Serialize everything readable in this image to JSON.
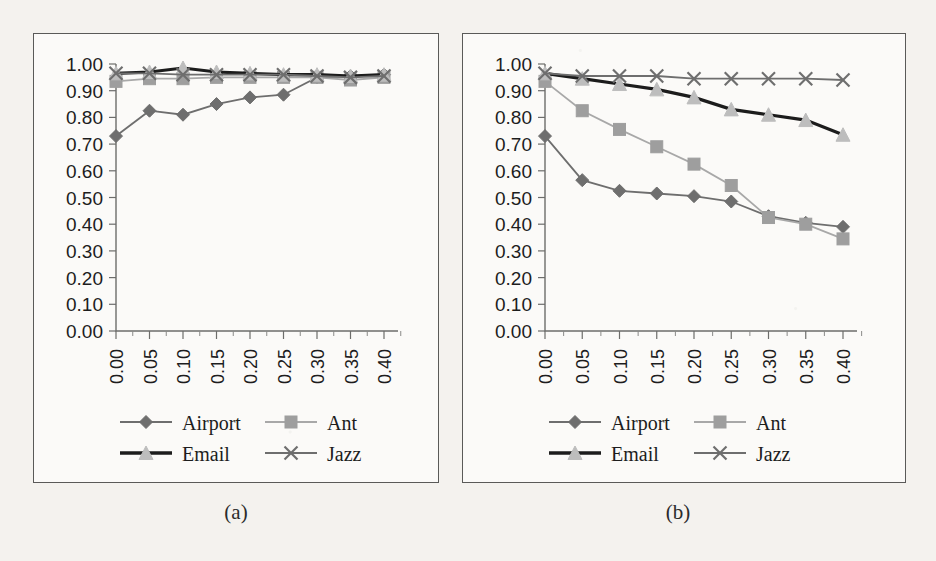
{
  "figure": {
    "background_color": "#f4f2ee",
    "panel_background": "#fbfaf8",
    "border_color": "#5a5a58"
  },
  "captions": {
    "a": "(a)",
    "b": "(b)"
  },
  "legend": {
    "position": "bottom",
    "columns": 2,
    "entries": [
      {
        "label": "Airport",
        "marker": "diamond",
        "color": "#6e6e6e",
        "line_color": "#6e6e6e"
      },
      {
        "label": "Ant",
        "marker": "square",
        "color": "#9e9e9e",
        "line_color": "#a8a8a8"
      },
      {
        "label": "Email",
        "marker": "triangle",
        "color": "#bdbdbd",
        "line_color": "#1c1c1c"
      },
      {
        "label": "Jazz",
        "marker": "cross",
        "color": "#6e6e6e",
        "line_color": "#6e6e6e"
      }
    ]
  },
  "chart_data": [
    {
      "type": "line",
      "title": "(a)",
      "xlabel": "",
      "ylabel": "",
      "grid": false,
      "legend_position": "bottom",
      "x": [
        0.0,
        0.05,
        0.1,
        0.15,
        0.2,
        0.25,
        0.3,
        0.35,
        0.4
      ],
      "xticklabels": [
        "0.00",
        "0.05",
        "0.10",
        "0.15",
        "0.20",
        "0.25",
        "0.30",
        "0.35",
        "0.40"
      ],
      "yticklabels": [
        "0.00",
        "0.10",
        "0.20",
        "0.30",
        "0.40",
        "0.50",
        "0.60",
        "0.70",
        "0.80",
        "0.90",
        "1.00"
      ],
      "xlim": [
        0.0,
        0.4
      ],
      "ylim": [
        0.0,
        1.0
      ],
      "series": [
        {
          "name": "Airport",
          "marker": "diamond",
          "color": "#6e6e6e",
          "line_color": "#6e6e6e",
          "values": [
            0.73,
            0.825,
            0.81,
            0.85,
            0.875,
            0.885,
            0.95,
            0.955,
            0.96
          ]
        },
        {
          "name": "Ant",
          "marker": "square",
          "color": "#9e9e9e",
          "line_color": "#a8a8a8",
          "values": [
            0.935,
            0.945,
            0.945,
            0.95,
            0.95,
            0.95,
            0.95,
            0.94,
            0.95
          ]
        },
        {
          "name": "Email",
          "marker": "triangle",
          "color": "#bdbdbd",
          "line_color": "#1c1c1c",
          "values": [
            0.965,
            0.97,
            0.985,
            0.97,
            0.965,
            0.96,
            0.96,
            0.955,
            0.96
          ]
        },
        {
          "name": "Jazz",
          "marker": "cross",
          "color": "#6e6e6e",
          "line_color": "#6e6e6e",
          "values": [
            0.965,
            0.965,
            0.96,
            0.96,
            0.96,
            0.96,
            0.955,
            0.95,
            0.955
          ]
        }
      ]
    },
    {
      "type": "line",
      "title": "(b)",
      "xlabel": "",
      "ylabel": "",
      "grid": false,
      "legend_position": "bottom",
      "x": [
        0.0,
        0.05,
        0.1,
        0.15,
        0.2,
        0.25,
        0.3,
        0.35,
        0.4
      ],
      "xticklabels": [
        "0.00",
        "0.05",
        "0.10",
        "0.15",
        "0.20",
        "0.25",
        "0.30",
        "0.35",
        "0.40"
      ],
      "yticklabels": [
        "0.00",
        "0.10",
        "0.20",
        "0.30",
        "0.40",
        "0.50",
        "0.60",
        "0.70",
        "0.80",
        "0.90",
        "1.00"
      ],
      "xlim": [
        0.0,
        0.4
      ],
      "ylim": [
        0.0,
        1.0
      ],
      "series": [
        {
          "name": "Airport",
          "marker": "diamond",
          "color": "#6e6e6e",
          "line_color": "#6e6e6e",
          "values": [
            0.73,
            0.565,
            0.525,
            0.515,
            0.505,
            0.485,
            0.43,
            0.405,
            0.39
          ]
        },
        {
          "name": "Ant",
          "marker": "square",
          "color": "#9e9e9e",
          "line_color": "#a8a8a8",
          "values": [
            0.935,
            0.825,
            0.755,
            0.69,
            0.625,
            0.545,
            0.425,
            0.4,
            0.345
          ]
        },
        {
          "name": "Email",
          "marker": "triangle",
          "color": "#bdbdbd",
          "line_color": "#1c1c1c",
          "values": [
            0.965,
            0.945,
            0.925,
            0.905,
            0.875,
            0.83,
            0.81,
            0.79,
            0.735
          ]
        },
        {
          "name": "Jazz",
          "marker": "cross",
          "color": "#6e6e6e",
          "line_color": "#6e6e6e",
          "values": [
            0.965,
            0.955,
            0.955,
            0.955,
            0.945,
            0.945,
            0.945,
            0.945,
            0.94
          ]
        }
      ]
    }
  ]
}
